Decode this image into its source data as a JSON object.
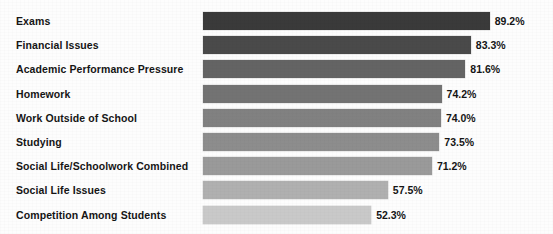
{
  "chart_data": {
    "type": "bar",
    "orientation": "horizontal",
    "title": "",
    "xlabel": "",
    "ylabel": "",
    "grid": false,
    "legend": false,
    "xlim": [
      0,
      100
    ],
    "value_suffix": "%",
    "categories": [
      "Exams",
      "Financial Issues",
      "Academic Performance Pressure",
      "Homework",
      "Work Outside of School",
      "Studying",
      "Social Life/Schoolwork Combined",
      "Social Life Issues",
      "Competition Among Students"
    ],
    "values": [
      89.2,
      83.3,
      81.6,
      74.2,
      74.0,
      73.5,
      71.2,
      57.5,
      52.3
    ],
    "value_labels": [
      "89.2%",
      "83.3%",
      "81.6%",
      "74.2%",
      "74.0%",
      "73.5%",
      "71.2%",
      "57.5%",
      "52.3%"
    ],
    "bar_colors": [
      "#3a3a3a",
      "#4a4a4a",
      "#646464",
      "#737373",
      "#818181",
      "#8d8d8d",
      "#9a9a9a",
      "#b0b0b0",
      "#c9c9c9"
    ],
    "background_color": "#fdfdfd",
    "text_color": "#151515"
  }
}
